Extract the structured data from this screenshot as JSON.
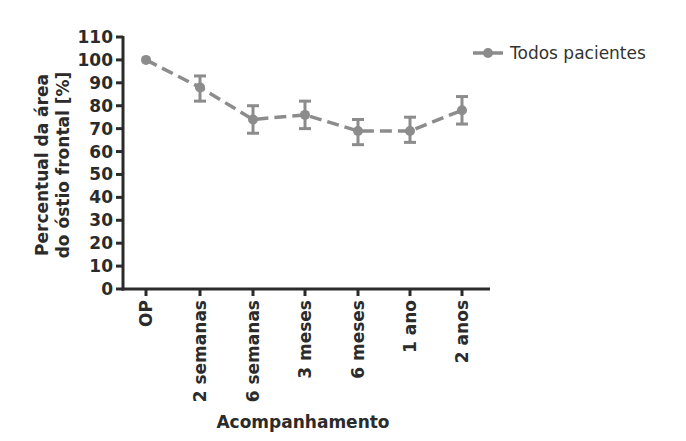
{
  "chart_data": {
    "type": "line",
    "title": "",
    "xlabel": "Acompanhamento",
    "ylabel": [
      "Percentual da área",
      "do óstio frontal [%]"
    ],
    "categories": [
      "OP",
      "2 semanas",
      "6 semanas",
      "3 meses",
      "6 meses",
      "1 ano",
      "2 anos"
    ],
    "series": [
      {
        "name": "Todos pacientes",
        "values": [
          100,
          88,
          74,
          76,
          69,
          69,
          78
        ],
        "error_low": [
          100,
          82,
          68,
          70,
          63,
          64,
          72
        ],
        "error_high": [
          100,
          93,
          80,
          82,
          74,
          75,
          84
        ],
        "color": "#8c8c8c",
        "line_style": "dashed",
        "marker": "circle"
      }
    ],
    "ylim": [
      0,
      110
    ],
    "yticks": [
      0,
      10,
      20,
      30,
      40,
      50,
      60,
      70,
      80,
      90,
      100,
      110
    ],
    "grid": false,
    "legend_position": "top-right",
    "axis_color": "#2b2b2b"
  }
}
